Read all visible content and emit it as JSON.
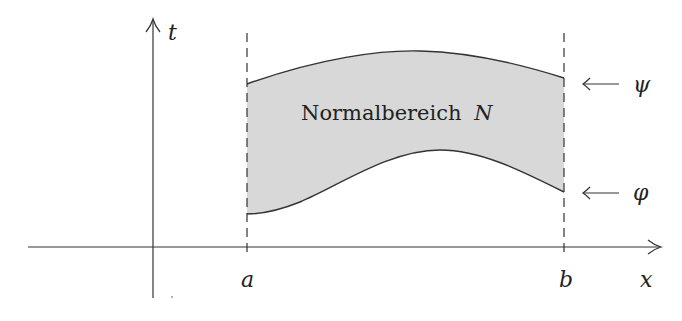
{
  "diagram": {
    "region_label": "Normalbereich",
    "region_symbol": "N",
    "axes": {
      "x_label": "x",
      "y_label": "t"
    },
    "bounds": {
      "left": "a",
      "right": "b"
    },
    "curves": {
      "upper": "ψ",
      "lower": "φ"
    },
    "colors": {
      "fill": "#d8d8d8",
      "stroke": "#333333",
      "axis": "#333333"
    }
  }
}
